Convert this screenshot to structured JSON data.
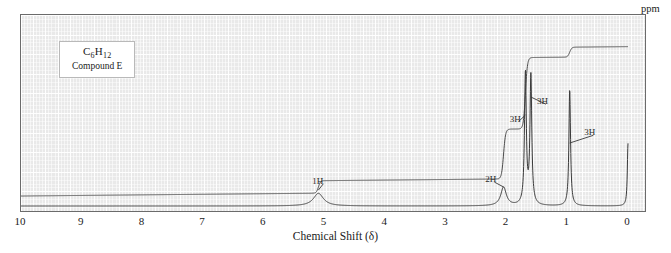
{
  "label_box": {
    "formula_main": "C",
    "formula_full": "C6H12",
    "formula_parts": [
      {
        "t": "C",
        "sub": false
      },
      {
        "t": "6",
        "sub": true
      },
      {
        "t": "H",
        "sub": false
      },
      {
        "t": "12",
        "sub": true
      }
    ],
    "compound": "Compound E"
  },
  "axis": {
    "title": "Chemical Shift (δ)",
    "unit": "ppm",
    "ticks": [
      "10",
      "9",
      "8",
      "7",
      "6",
      "5",
      "4",
      "3",
      "2",
      "1",
      "0"
    ],
    "tick_values": [
      10,
      9,
      8,
      7,
      6,
      5,
      4,
      3,
      2,
      1,
      0
    ],
    "xmin": 0,
    "xmax": 10,
    "direction": "reversed"
  },
  "annotations": [
    {
      "label": "1H",
      "x_ppm": 5.2,
      "y_frac": 0.86
    },
    {
      "label": "2H",
      "x_ppm": 2.35,
      "y_frac": 0.85
    },
    {
      "label": "3H",
      "x_ppm": 1.95,
      "y_frac": 0.5
    },
    {
      "label": "3H",
      "x_ppm": 1.5,
      "y_frac": 0.4
    },
    {
      "label": "3H",
      "x_ppm": 0.72,
      "y_frac": 0.58
    }
  ],
  "chart_data": {
    "type": "line",
    "title": "",
    "subtitle": "Compound E  (C6H12) proton NMR spectrum",
    "xlabel": "Chemical Shift (δ)",
    "ylabel": "",
    "xlim": [
      10,
      0
    ],
    "ylim": [
      0,
      1
    ],
    "grid": true,
    "legend": "none",
    "series": [
      {
        "name": "spectrum",
        "description": "1H NMR absorption trace",
        "peaks": [
          {
            "shift_ppm": 5.1,
            "rel_height": 0.085,
            "width_ppm": 0.1,
            "integration": "1H",
            "multiplicity": "multiplet"
          },
          {
            "shift_ppm": 2.05,
            "rel_height": 0.125,
            "width_ppm": 0.055,
            "integration": "2H",
            "multiplicity": "multiplet"
          },
          {
            "shift_ppm": 1.69,
            "rel_height": 0.88,
            "width_ppm": 0.018,
            "integration": "3H",
            "multiplicity": "singlet"
          },
          {
            "shift_ppm": 1.6,
            "rel_height": 0.86,
            "width_ppm": 0.018,
            "integration": "3H",
            "multiplicity": "singlet"
          },
          {
            "shift_ppm": 0.96,
            "rel_height": 0.78,
            "width_ppm": 0.016,
            "integration": "3H",
            "multiplicity": "singlet"
          },
          {
            "shift_ppm": 0.0,
            "rel_height": 0.42,
            "width_ppm": 0.013,
            "integration": "TMS",
            "multiplicity": "reference"
          }
        ]
      },
      {
        "name": "integral",
        "description": "stepped integration curve, rises left to right",
        "steps": [
          {
            "shift_ppm": 10.0,
            "level": 0.03
          },
          {
            "shift_ppm": 5.1,
            "level": 0.03,
            "rise": 0.075
          },
          {
            "shift_ppm": 5.0,
            "level": 0.105
          },
          {
            "shift_ppm": 2.05,
            "level": 0.15,
            "rise": 0.3
          },
          {
            "shift_ppm": 1.9,
            "level": 0.45
          },
          {
            "shift_ppm": 1.69,
            "level": 0.47,
            "rise": 0.43
          },
          {
            "shift_ppm": 1.55,
            "level": 0.9
          },
          {
            "shift_ppm": 0.96,
            "level": 0.915,
            "rise": 0.06
          },
          {
            "shift_ppm": 0.0,
            "level": 0.975
          }
        ]
      }
    ]
  }
}
